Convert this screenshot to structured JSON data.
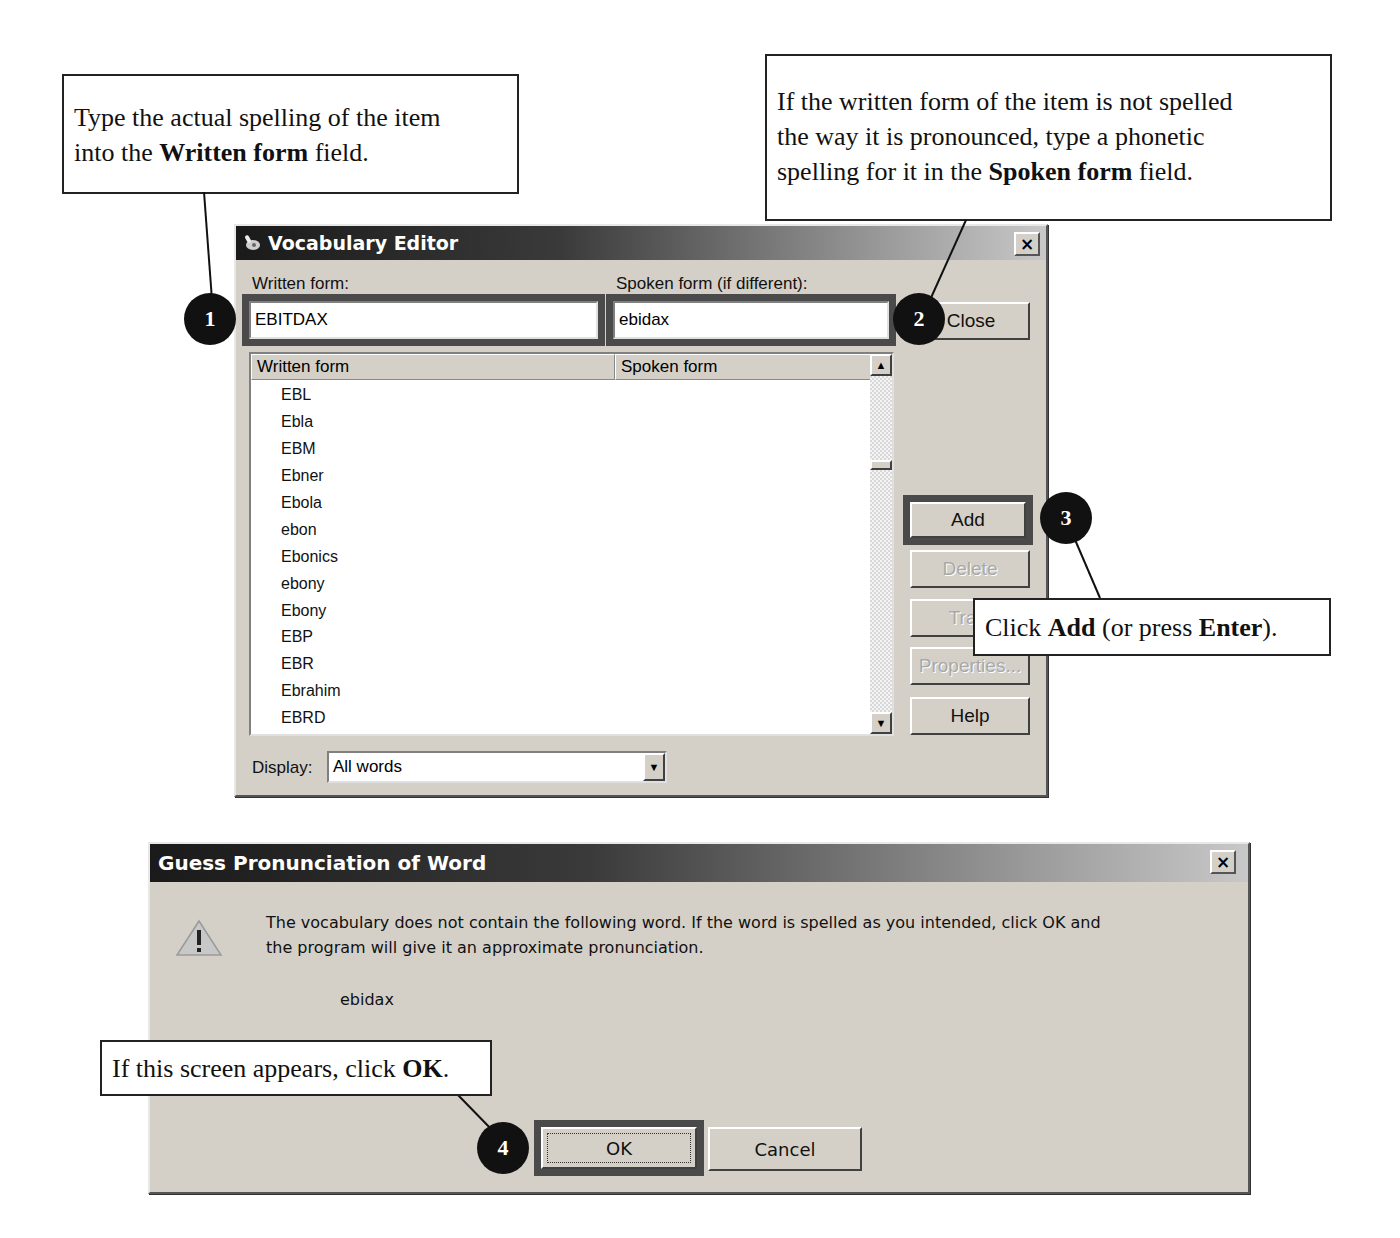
{
  "callouts": {
    "written": {
      "line1": "Type the actual spelling of the item",
      "line2_pre": "into the ",
      "line2_bold": "Written form",
      "line2_post": " field."
    },
    "spoken": {
      "line1": "If the written form of the item is not spelled",
      "line2": "the way it is pronounced, type a phonetic",
      "line3_pre": "spelling for it in the ",
      "line3_bold": "Spoken form",
      "line3_post": " field."
    },
    "add": {
      "pre": "Click ",
      "bold1": "Add",
      "mid": " (or press ",
      "bold2": "Enter",
      "post": ")."
    },
    "ok": {
      "pre": "If this screen appears, click ",
      "bold": "OK",
      "post": "."
    }
  },
  "badges": [
    "1",
    "2",
    "3",
    "4"
  ],
  "vocab_editor": {
    "title": "Vocabulary Editor",
    "close_glyph": "×",
    "written_label": "Written form:",
    "written_value": "EBITDAX",
    "spoken_label": "Spoken form (if different):",
    "spoken_value": "ebidax",
    "list": {
      "columns": [
        "Written form",
        "Spoken form"
      ],
      "rows": [
        "EBL",
        "Ebla",
        "EBM",
        "Ebner",
        "Ebola",
        "ebon",
        "Ebonics",
        "ebony",
        "Ebony",
        "EBP",
        "EBR",
        "Ebrahim",
        "EBRD"
      ],
      "scroll_up": "▲",
      "scroll_down": "▼"
    },
    "buttons": {
      "close": "Close",
      "add": "Add",
      "delete": "Delete",
      "train": "Train",
      "properties": "Properties...",
      "help": "Help"
    },
    "display_label": "Display:",
    "display_value": "All words",
    "dropdown_glyph": "▼"
  },
  "guess_dialog": {
    "title": "Guess Pronunciation of Word",
    "close_glyph": "×",
    "warning_glyph": "!",
    "message_line1": "The vocabulary does not contain the following word. If the word is spelled as you intended, click OK and",
    "message_line2": "the program will give it an approximate pronunciation.",
    "word": "ebidax",
    "ok_label": "OK",
    "cancel_label": "Cancel"
  }
}
